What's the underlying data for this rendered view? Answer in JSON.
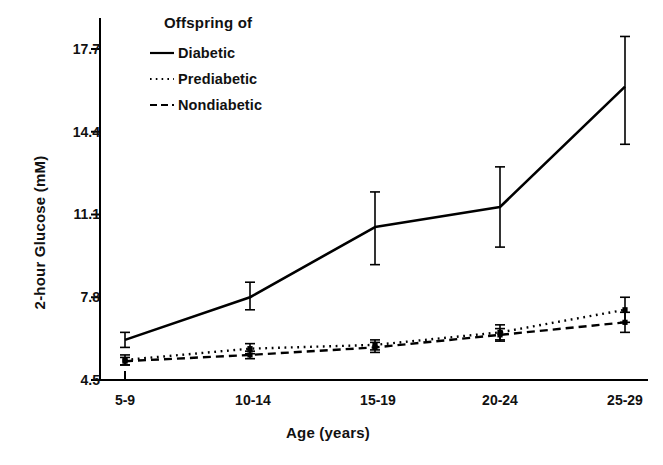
{
  "chart_data": {
    "type": "line",
    "title": "",
    "xlabel": "Age (years)",
    "ylabel": "2-hour Glucose (mM)",
    "categories": [
      "5-9",
      "10-14",
      "15-19",
      "20-24",
      "25-29"
    ],
    "ytick_labels": [
      "17.7",
      "14.4",
      "11.1",
      "7.8",
      "4.5"
    ],
    "ytick_values": [
      17.7,
      14.4,
      11.1,
      7.8,
      4.5
    ],
    "ylim": [
      4.5,
      18.6
    ],
    "grid": false,
    "legend_position": "upper-left-inside",
    "legend_title": "Offspring of",
    "error_bars": "whisker-caps, symmetric",
    "series": [
      {
        "name": "Diabetic",
        "style": "solid",
        "color": "#000000",
        "values": [
          6.1,
          7.8,
          10.6,
          11.4,
          16.2
        ],
        "err_low": [
          5.8,
          7.3,
          9.1,
          9.8,
          13.9
        ],
        "err_high": [
          6.4,
          8.4,
          12.0,
          13.0,
          18.2
        ]
      },
      {
        "name": "Prediabetic",
        "style": "dotted",
        "color": "#000000",
        "values": [
          5.3,
          5.75,
          5.9,
          6.4,
          7.3
        ],
        "err_low": [
          5.1,
          5.55,
          5.7,
          6.1,
          6.8
        ],
        "err_high": [
          5.5,
          5.95,
          6.1,
          6.7,
          7.8
        ]
      },
      {
        "name": "Nondiabetic",
        "style": "dashed",
        "color": "#000000",
        "values": [
          5.25,
          5.5,
          5.8,
          6.3,
          6.8
        ],
        "err_low": [
          5.1,
          5.35,
          5.6,
          6.05,
          6.4
        ],
        "err_high": [
          5.4,
          5.65,
          6.0,
          6.55,
          7.2
        ]
      }
    ]
  },
  "legend": {
    "title": "Offspring of",
    "items": [
      {
        "label": "Diabetic",
        "icon": "solid-line-icon"
      },
      {
        "label": "Prediabetic",
        "icon": "dotted-line-icon"
      },
      {
        "label": "Nondiabetic",
        "icon": "dashed-line-icon"
      }
    ]
  },
  "axes": {
    "y_title": "2-hour Glucose (mM)",
    "x_title": "Age (years)",
    "y_ticks": [
      "17.7",
      "14.4",
      "11.1",
      "7.8",
      "4.5"
    ],
    "x_ticks": [
      "5-9",
      "10-14",
      "15-19",
      "20-24",
      "25-29"
    ]
  }
}
